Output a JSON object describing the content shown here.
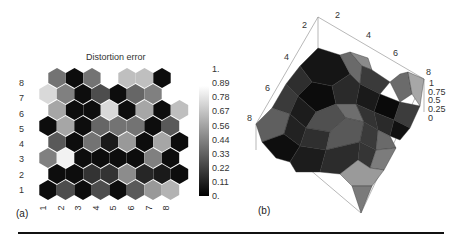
{
  "figure": {
    "panel_a_label": "(a)",
    "panel_b_label": "(b)"
  },
  "chart_data": [
    {
      "type": "heatmap",
      "subtype": "hexagonal-som-grid",
      "title": "Distortion error",
      "xlabel": "",
      "ylabel": "",
      "x_ticks": [
        "1",
        "2",
        "3",
        "4",
        "5",
        "6",
        "7",
        "8"
      ],
      "y_ticks": [
        "1",
        "2",
        "3",
        "4",
        "5",
        "6",
        "7",
        "8"
      ],
      "colorbar": {
        "ticks": [
          "0.",
          "0.11",
          "0.22",
          "0.33",
          "0.44",
          "0.56",
          "0.67",
          "0.78",
          "0.89",
          "1."
        ],
        "range": [
          0,
          1
        ],
        "colormap": "grayscale (black=0, white=1)"
      },
      "rows": [
        {
          "row": 8,
          "values": [
            0.45,
            0.05,
            0.45,
            1.0,
            0.75,
            0.75,
            0.05,
            null
          ]
        },
        {
          "row": 7,
          "values": [
            0.85,
            0.5,
            0.05,
            0.3,
            0.05,
            0.4,
            0.5,
            null
          ]
        },
        {
          "row": 6,
          "values": [
            0.65,
            0.05,
            0.05,
            0.85,
            0.05,
            0.65,
            0.05,
            0.75
          ]
        },
        {
          "row": 5,
          "values": [
            0.05,
            0.65,
            0.05,
            0.4,
            0.45,
            0.45,
            0.05,
            0.35
          ]
        },
        {
          "row": 4,
          "values": [
            0.35,
            0.05,
            0.45,
            0.1,
            0.6,
            0.05,
            0.65,
            0.05
          ]
        },
        {
          "row": 3,
          "values": [
            0.5,
            0.95,
            0.05,
            0.05,
            0.05,
            0.05,
            0.5,
            0.05
          ]
        },
        {
          "row": 2,
          "values": [
            0.05,
            0.05,
            0.2,
            0.2,
            0.55,
            0.15,
            0.1,
            0.05
          ]
        },
        {
          "row": 1,
          "values": [
            0.05,
            0.3,
            0.05,
            0.3,
            0.05,
            0.35,
            0.6,
            0.7
          ]
        }
      ],
      "legend_position": "right",
      "grid": false
    },
    {
      "type": "surface3d",
      "title": "",
      "x_ticks": [
        "2",
        "4",
        "6",
        "8"
      ],
      "y_ticks": [
        "2",
        "4",
        "6",
        "8"
      ],
      "z_ticks": [
        "0",
        "0.25",
        "0.5",
        "0.75",
        "1"
      ],
      "z_range": [
        0,
        1
      ],
      "shading": "grayscale faceted",
      "box": true
    }
  ]
}
